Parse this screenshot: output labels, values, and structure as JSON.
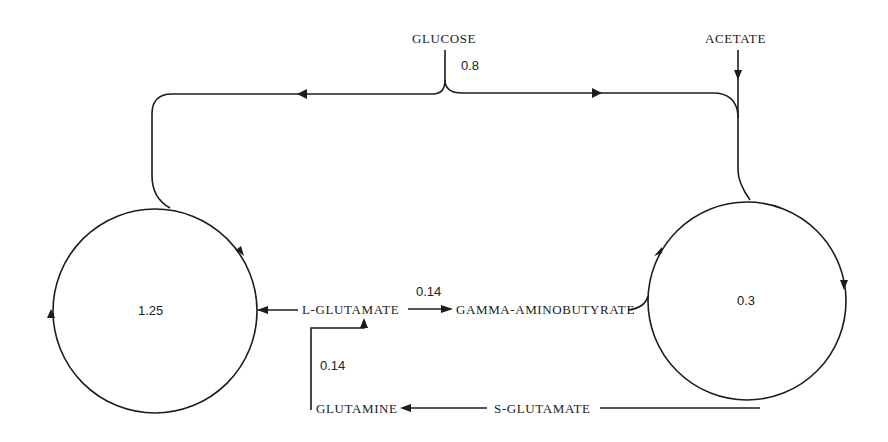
{
  "diagram": {
    "nodes": {
      "glucose": "GLUCOSE",
      "acetate": "ACETATE",
      "l_glutamate": "L-GLUTAMATE",
      "gaba": "GAMMA-AMINOBUTYRATE",
      "glutamine": "GLUTAMINE",
      "s_glutamate": "S-GLUTAMATE"
    },
    "pools": {
      "left": "1.25",
      "right": "0.3"
    },
    "rates": {
      "glucose_flux": "0.8",
      "glutamate_to_gaba": "0.14",
      "glutamine_to_glutamate": "0.14"
    },
    "colors": {
      "line": "#1c1c1c",
      "background": "#ffffff"
    }
  }
}
